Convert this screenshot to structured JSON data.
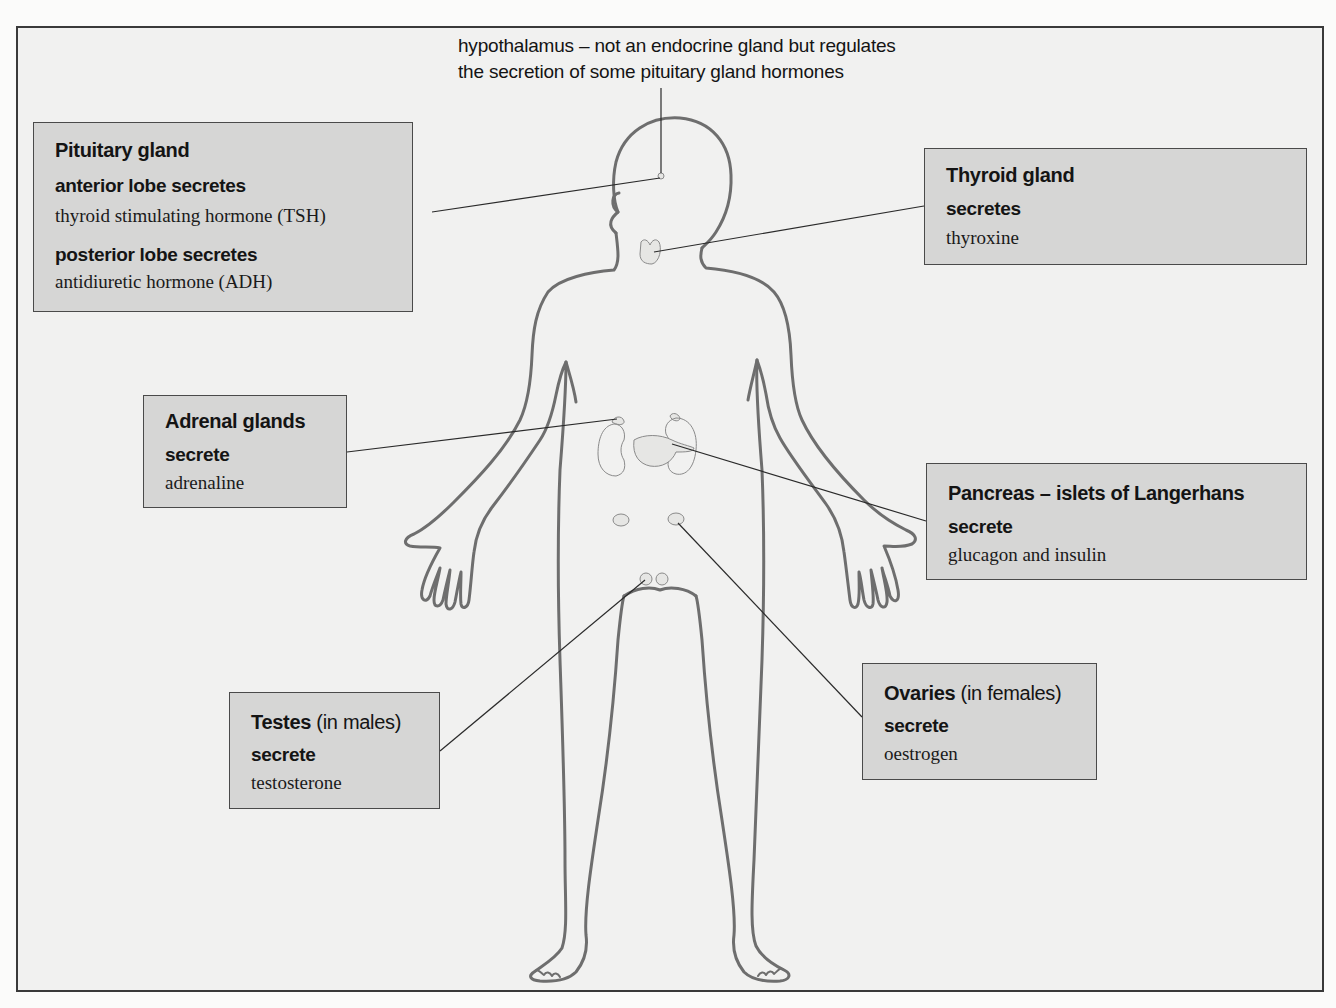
{
  "diagram": {
    "colors": {
      "background": "#f1f1f0",
      "box_fill": "#d6d6d5",
      "box_border": "#4a4a4a",
      "body_outline": "#6e6e6e",
      "leader_line": "#2a2a2a",
      "gland_fill": "#e6e6e4"
    },
    "hypothalamus": {
      "line1": "hypothalamus – not an endocrine gland but regulates",
      "line2": "the secretion of some pituitary gland hormones"
    },
    "labels": {
      "pituitary": {
        "title": "Pituitary gland",
        "sub1": "anterior lobe secretes",
        "hormone1": "thyroid stimulating hormone (TSH)",
        "sub2": "posterior lobe secretes",
        "hormone2": "antidiuretic hormone (ADH)"
      },
      "thyroid": {
        "title": "Thyroid gland",
        "sub": "secretes",
        "hormone": "thyroxine"
      },
      "adrenal": {
        "title": "Adrenal glands",
        "sub": "secrete",
        "hormone": "adrenaline"
      },
      "pancreas": {
        "title": "Pancreas – islets of Langerhans",
        "sub": "secrete",
        "hormone": "glucagon and insulin"
      },
      "testes": {
        "title_bold": "Testes",
        "title_light": " (in males)",
        "sub": "secrete",
        "hormone": "testosterone"
      },
      "ovaries": {
        "title_bold": "Ovaries",
        "title_light": " (in females)",
        "sub": "secrete",
        "hormone": "oestrogen"
      }
    }
  }
}
